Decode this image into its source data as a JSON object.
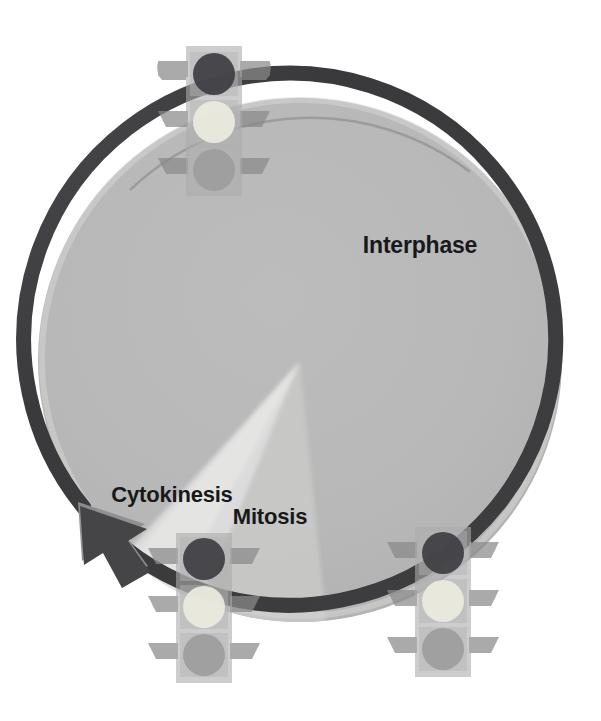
{
  "diagram": {
    "type": "cycle-diagram",
    "background_color": "#ffffff"
  },
  "cycle": {
    "ring_color": "#3d3d40",
    "ring_shadow_color": "#8d8d90",
    "disc_color": "#b7b7b7",
    "disc_highlight_color": "#d8d8d6",
    "direction": "counterclockwise",
    "arrowhead_color": "#4a4a4d",
    "arrowhead_bevel_color": "#8f8f92",
    "center": {
      "x": 300,
      "y": 360
    },
    "radius": 272
  },
  "labels": {
    "interphase": "Interphase",
    "cytokinesis": "Cytokinesis",
    "mitosis": "Mitosis"
  },
  "wedges": [
    {
      "name": "mitosis-wedge",
      "color": "#c6c6c4"
    },
    {
      "name": "cytokinesis-wedge",
      "color": "#dcdcda"
    }
  ],
  "checkpoints": [
    {
      "id": "g1-checkpoint",
      "position": "top",
      "x": 186,
      "y": 46,
      "lights": [
        {
          "name": "red-light",
          "color": "#3e3e42",
          "state": "dark"
        },
        {
          "name": "yellow-light",
          "color": "#ebebe2",
          "state": "lit"
        },
        {
          "name": "green-light",
          "color": "#9d9d9d",
          "state": "dim"
        }
      ]
    },
    {
      "id": "g2-checkpoint",
      "position": "bottom-left",
      "x": 204,
      "y": 533,
      "lights": [
        {
          "name": "red-light",
          "color": "#3e3e42",
          "state": "dark"
        },
        {
          "name": "yellow-light",
          "color": "#ebebe2",
          "state": "lit"
        },
        {
          "name": "green-light",
          "color": "#9d9d9d",
          "state": "dim"
        }
      ]
    },
    {
      "id": "m-checkpoint",
      "position": "bottom-right",
      "x": 443,
      "y": 527,
      "lights": [
        {
          "name": "red-light",
          "color": "#3e3e42",
          "state": "dark"
        },
        {
          "name": "yellow-light",
          "color": "#ebebe2",
          "state": "lit"
        },
        {
          "name": "green-light",
          "color": "#9d9d9d",
          "state": "dim"
        }
      ]
    }
  ],
  "traffic_light_style": {
    "body_color": "#a9a9a9",
    "body_opacity": 0.62,
    "hood_color": "#8b8b8b",
    "hood_opacity": 0.75,
    "width": 56,
    "height": 150
  }
}
